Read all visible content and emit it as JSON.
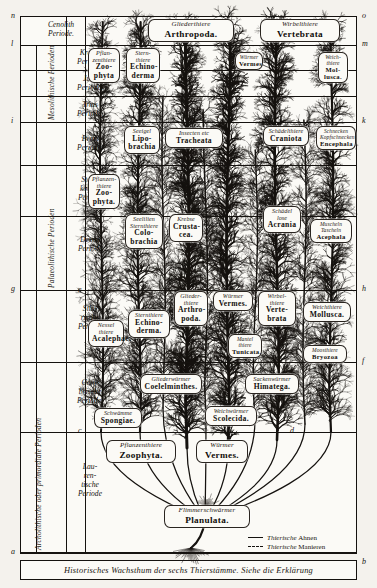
{
  "plate": {
    "caption": "Historisches Wachsthum der sechs Thierstämme.   Siehe die Erklärung"
  },
  "edge_letters": {
    "top_left": "n",
    "top_right": "o",
    "l_left": "l",
    "m_right": "m",
    "i_left": "i",
    "k_right": "k",
    "g_left": "g",
    "h_right": "h",
    "e_left": "e",
    "f_right": "f",
    "c_left": "c",
    "d_right": "d",
    "a_left": "a",
    "b_right": "b"
  },
  "sidebar": {
    "eras": [
      {
        "name": "Kaenozoische Periode",
        "short": "Cenolith Periode"
      },
      {
        "name": "Mesolithische Perioden",
        "rotated": true
      },
      {
        "name": "Palaeolithische Perioden",
        "rotated": true
      },
      {
        "name": "Archolithische oder primordiale Perioden",
        "rotated": true
      }
    ],
    "periods": [
      {
        "label": "Cenolith\nPeriode."
      },
      {
        "label": "Kreide\nPeriode."
      },
      {
        "label": "Jura\nPeriode."
      },
      {
        "label": "Trias\nPeriode."
      },
      {
        "label": "Perm\nPeriode."
      },
      {
        "label": "Stein-\nkohlen\nPeriode"
      },
      {
        "label": "Devon\nPeriode"
      },
      {
        "label": "Silu-\nrische\nPeriode"
      },
      {
        "label": "Cam-\nbrische\nPeriode."
      },
      {
        "label": "Lau-\nren-\ntische\nPeriode"
      }
    ],
    "era_labels": {
      "mesolith": "Mesolithische Perioden",
      "palaeolith": "Palaeolithische Perioden",
      "archolith": "Archolithische oder primordiale Perioden"
    }
  },
  "taxa": [
    {
      "id": "zoophyta-top",
      "de": "Pflan-\nzenthiere",
      "la": "Zoo-\nphyta"
    },
    {
      "id": "echinoderma-top",
      "de": "Stern-\nthiere",
      "la": "Echino-\nderma"
    },
    {
      "id": "arthropoda-top",
      "de": "Gliederthiere",
      "la": "Arthropoda."
    },
    {
      "id": "vermes-top",
      "de": "Würmer",
      "la": "Vermes"
    },
    {
      "id": "vertebrata-top",
      "de": "Wirbelthiere",
      "la": "Vertebrata"
    },
    {
      "id": "mollusca-top",
      "de": "Weich-\nthiere",
      "la": "Mol-\nlusca."
    },
    {
      "id": "lipobrachia",
      "de": "Seeigel",
      "la": "Lipo-\nbrachia"
    },
    {
      "id": "tracheata",
      "de": "Insecten etc",
      "la": "Tracheata"
    },
    {
      "id": "craniota",
      "de": "Schädelthiere",
      "la": "Craniota"
    },
    {
      "id": "encephala",
      "de": "Schnecken\nKopfschnecken",
      "la": "Encephala"
    },
    {
      "id": "zoophyta-2",
      "de": "Pflanzen-\nthiere",
      "la": "Zoo-\nphyta."
    },
    {
      "id": "colobrachia",
      "de": "Seelilien\nSternthiere",
      "la": "Colo-\nbrachia"
    },
    {
      "id": "crustacea",
      "de": "Krebse",
      "la": "Crusta-\ncea."
    },
    {
      "id": "acrania",
      "de": "Schädel\nlose",
      "la": "Acrania"
    },
    {
      "id": "acephala",
      "de": "Muscheln\nTascheln",
      "la": "Acephala"
    },
    {
      "id": "acalephae",
      "de": "Nessel\nthiere",
      "la": "Acalephae."
    },
    {
      "id": "echinoderma-2",
      "de": "Sternthiere",
      "la": "Echino-\nderma."
    },
    {
      "id": "arthropoda-2",
      "de": "Glieder-\nthiere",
      "la": "Arthro-\npoda."
    },
    {
      "id": "vermes-2",
      "de": "Würmer",
      "la": "Vermes."
    },
    {
      "id": "vertebrata-2",
      "de": "Wirbel-\nthiere",
      "la": "Verte-\nbrata"
    },
    {
      "id": "mollusca-2",
      "de": "Weichthiere",
      "la": "Mollusca."
    },
    {
      "id": "tunicata",
      "de": "Mantel\nthiere",
      "la": "Tunicata."
    },
    {
      "id": "bryozoa",
      "de": "Moosthiere",
      "la": "Bryozoa"
    },
    {
      "id": "coelelminthes",
      "de": "Gliederwürmer",
      "la": "Coelelminthes."
    },
    {
      "id": "himatega",
      "de": "Sackenwürmer",
      "la": "Himatega."
    },
    {
      "id": "spongiae",
      "de": "Schwämme",
      "la": "Spongiae."
    },
    {
      "id": "scolecida",
      "de": "Weichwürmer",
      "la": "Scolecida."
    },
    {
      "id": "zoophyta-root",
      "de": "Pflanzenthiere",
      "la": "Zoophyta."
    },
    {
      "id": "vermes-root",
      "de": "Würmer",
      "la": "Vermes."
    },
    {
      "id": "planulata",
      "de": "Flimmerschwärmer",
      "la": "Planulata."
    }
  ],
  "legend": {
    "entries": [
      {
        "style": "solid",
        "de": "Thierische ",
        "la": "Ahnen"
      },
      {
        "style": "dashed",
        "de": "Thierische ",
        "la": "Manieren"
      }
    ]
  },
  "colors": {
    "ink": "#15120f",
    "paper": "#fbfaf6",
    "plate": "#f4f2ed"
  }
}
